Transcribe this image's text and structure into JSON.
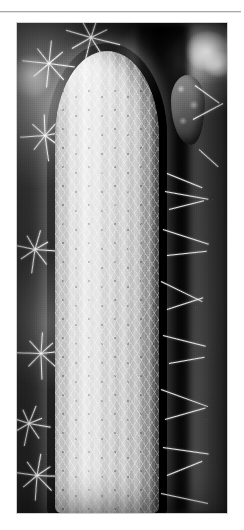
{
  "page": {
    "background_color": "#ffffff",
    "width": 244,
    "height": 530
  },
  "divider": {
    "name": "horizontal-rule",
    "color": "#a8a8a8"
  },
  "figure": {
    "alt_text": "Black and white photograph of a columnar cactus densely covered in pale radiating spines",
    "frame": {
      "left": 17,
      "top": 23,
      "width": 210,
      "height": 490,
      "border_color": "#cfcfcf"
    },
    "palette": {
      "background_dark": "#0b0b0b",
      "background_mid": "#3a3a3a",
      "stem_light": "#d8d8d8",
      "stem_mid": "#bdbdbd",
      "spine_white": "#ffffff",
      "highlight": "#f5f5f5"
    },
    "subject": {
      "name": "columnar-cactus",
      "description": "Upright cylindrical cactus stem with rounded apex, vertical ribs and dense white radial spines"
    },
    "elements": [
      {
        "name": "cactus-stem",
        "kind": "subject"
      },
      {
        "name": "cactus-apex",
        "kind": "subject-detail"
      },
      {
        "name": "areole-grid",
        "kind": "subject-detail"
      },
      {
        "name": "spine-cluster-left-upper",
        "kind": "background-detail"
      },
      {
        "name": "spine-cluster-left-mid",
        "kind": "background-detail"
      },
      {
        "name": "spine-cluster-left-lower",
        "kind": "background-detail"
      },
      {
        "name": "spine-cluster-bottom-left",
        "kind": "background-detail"
      },
      {
        "name": "background-cactus-right",
        "kind": "background-detail"
      },
      {
        "name": "flower-bud-mass",
        "kind": "background-detail"
      },
      {
        "name": "backlight-bloom",
        "kind": "lighting"
      },
      {
        "name": "shadow-crevice",
        "kind": "background-detail"
      }
    ]
  }
}
